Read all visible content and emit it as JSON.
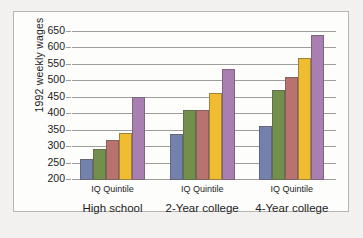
{
  "chart_data": {
    "type": "bar",
    "title": "",
    "xlabel": "IQ Quintile",
    "ylabel": "1992 weekly wages",
    "ylim": [
      200,
      650
    ],
    "yticks": [
      200,
      250,
      300,
      350,
      400,
      450,
      500,
      550,
      600,
      650
    ],
    "grid": true,
    "legend": "none",
    "categories": [
      "High school",
      "2-Year college",
      "4-Year college"
    ],
    "group_axis_label": "IQ Quintile",
    "series": [
      {
        "name": "Quintile 1",
        "color": "#7382ac",
        "values": [
          265,
          339,
          363
        ]
      },
      {
        "name": "Quintile 2",
        "color": "#72904b",
        "values": [
          295,
          412,
          473
        ]
      },
      {
        "name": "Quintile 3",
        "color": "#b9736f",
        "values": [
          322,
          413,
          512
        ]
      },
      {
        "name": "Quintile 4",
        "color": "#f0bc30",
        "values": [
          342,
          465,
          570
        ]
      },
      {
        "name": "Quintile 5",
        "color": "#a87fb0",
        "values": [
          452,
          538,
          640
        ]
      }
    ]
  }
}
